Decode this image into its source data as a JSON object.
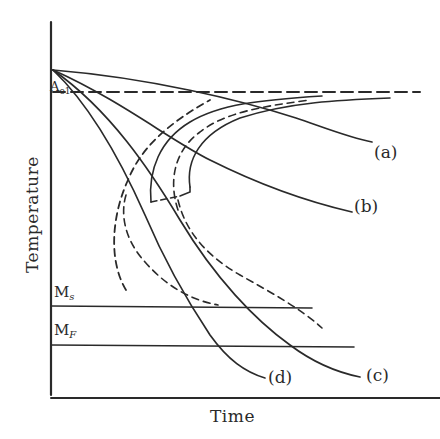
{
  "figure": {
    "type": "continuous-cooling-transformation diagram",
    "axes": {
      "x_label": "Time",
      "y_label": "Temperature"
    },
    "reference_lines": {
      "ae1": {
        "label": "A",
        "sub": "e1",
        "style": "dashed"
      },
      "ms": {
        "label": "M",
        "sub": "s",
        "style": "solid"
      },
      "mf": {
        "label": "M",
        "sub": "F",
        "style": "solid"
      }
    },
    "cooling_curves": [
      {
        "id": "a",
        "label": "(a)"
      },
      {
        "id": "b",
        "label": "(b)"
      },
      {
        "id": "c",
        "label": "(c)"
      },
      {
        "id": "d",
        "label": "(d)"
      }
    ],
    "transformation_curves": [
      {
        "name": "transformation-start",
        "style": "solid"
      },
      {
        "name": "transformation-finish",
        "style": "dashed"
      }
    ],
    "colors": {
      "ink": "#2a2a2a",
      "background": "#ffffff"
    }
  }
}
